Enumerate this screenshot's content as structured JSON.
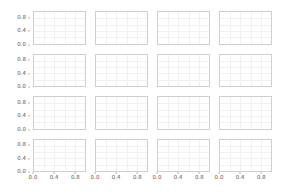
{
  "figure": {
    "background_color": "#ffffff",
    "axes_edge_color": "#cfcfcf",
    "grid_color": "#f0f0f0",
    "tick_label_color": "#555555"
  },
  "chart_data": {
    "type": "scatter",
    "title": "",
    "subtitle": "",
    "xlabel": "",
    "ylabel": "",
    "layout": {
      "rows": 4,
      "cols": 4,
      "panels": 16,
      "shared_x": true,
      "shared_y": true,
      "grid": true,
      "legend": "none"
    },
    "xlim": [
      0.0,
      1.0
    ],
    "ylim": [
      0.0,
      1.0
    ],
    "xticks": [
      0.0,
      0.2,
      0.4,
      0.6,
      0.8
    ],
    "yticks": [
      0.0,
      0.2,
      0.4,
      0.6,
      0.8
    ],
    "xtick_labels": [
      "0.0",
      "0.4",
      "0.8"
    ],
    "ytick_labels": [
      "0.8",
      "0.4",
      "0.0"
    ],
    "xtick_label_values": [
      0.0,
      0.4,
      0.8
    ],
    "ytick_label_values": [
      0.8,
      0.4,
      0.0
    ],
    "series": [],
    "values": [],
    "categories": [],
    "annotations": []
  },
  "panels": [
    {
      "row": 0,
      "col": 0,
      "title": "",
      "values": []
    },
    {
      "row": 0,
      "col": 1,
      "title": "",
      "values": []
    },
    {
      "row": 0,
      "col": 2,
      "title": "",
      "values": []
    },
    {
      "row": 0,
      "col": 3,
      "title": "",
      "values": []
    },
    {
      "row": 1,
      "col": 0,
      "title": "",
      "values": []
    },
    {
      "row": 1,
      "col": 1,
      "title": "",
      "values": []
    },
    {
      "row": 1,
      "col": 2,
      "title": "",
      "values": []
    },
    {
      "row": 1,
      "col": 3,
      "title": "",
      "values": []
    },
    {
      "row": 2,
      "col": 0,
      "title": "",
      "values": []
    },
    {
      "row": 2,
      "col": 1,
      "title": "",
      "values": []
    },
    {
      "row": 2,
      "col": 2,
      "title": "",
      "values": []
    },
    {
      "row": 2,
      "col": 3,
      "title": "",
      "values": []
    },
    {
      "row": 3,
      "col": 0,
      "title": "",
      "values": []
    },
    {
      "row": 3,
      "col": 1,
      "title": "",
      "values": []
    },
    {
      "row": 3,
      "col": 2,
      "title": "",
      "values": []
    },
    {
      "row": 3,
      "col": 3,
      "title": "",
      "values": []
    }
  ]
}
